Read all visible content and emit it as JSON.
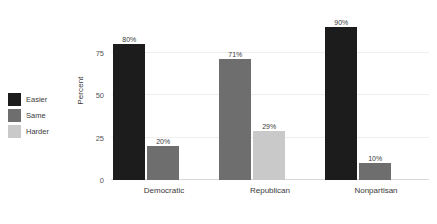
{
  "chart_data": {
    "type": "bar",
    "title": "",
    "subtitle": "",
    "xlabel": "",
    "ylabel": "Percent",
    "ylim": [
      0,
      100
    ],
    "yticks": [
      0,
      25,
      50,
      75
    ],
    "ytick_labels": [
      "0",
      "25",
      "50",
      "75"
    ],
    "grid": true,
    "grid_axis": "y",
    "legend_position": "left-outside",
    "categories": [
      "Democratic",
      "Republican",
      "Nonpartisan"
    ],
    "series": [
      {
        "name": "Easier",
        "color": "#1c1c1c",
        "values": [
          80,
          null,
          90
        ],
        "labels": [
          "80%",
          "",
          "90%"
        ]
      },
      {
        "name": "Same",
        "color": "#6e6e6e",
        "values": [
          20,
          71,
          10
        ],
        "labels": [
          "20%",
          "71%",
          "10%"
        ]
      },
      {
        "name": "Harder",
        "color": "#c9c9c9",
        "values": [
          null,
          29,
          null
        ],
        "labels": [
          "",
          "29%",
          ""
        ]
      }
    ],
    "bars": [
      {
        "category": "Democratic",
        "series": "Easier",
        "value": 80,
        "label": "80%",
        "color": "#1c1c1c",
        "slot": 0
      },
      {
        "category": "Democratic",
        "series": "Same",
        "value": 20,
        "label": "20%",
        "color": "#6e6e6e",
        "slot": 1
      },
      {
        "category": "Republican",
        "series": "Same",
        "value": 71,
        "label": "71%",
        "color": "#6e6e6e",
        "slot": 0
      },
      {
        "category": "Republican",
        "series": "Harder",
        "value": 29,
        "label": "29%",
        "color": "#c9c9c9",
        "slot": 1
      },
      {
        "category": "Nonpartisan",
        "series": "Easier",
        "value": 90,
        "label": "90%",
        "color": "#1c1c1c",
        "slot": 0
      },
      {
        "category": "Nonpartisan",
        "series": "Same",
        "value": 10,
        "label": "10%",
        "color": "#6e6e6e",
        "slot": 1
      }
    ]
  },
  "legend": {
    "items": [
      {
        "label": "Easier",
        "color": "#1c1c1c"
      },
      {
        "label": "Same",
        "color": "#6e6e6e"
      },
      {
        "label": "Harder",
        "color": "#c9c9c9"
      }
    ]
  },
  "axes": {
    "y_title": "Percent",
    "y_tick_labels": [
      "0",
      "25",
      "50",
      "75"
    ],
    "x_tick_labels": [
      "Democratic",
      "Republican",
      "Nonpartisan"
    ]
  },
  "colors": {
    "background": "#ffffff",
    "gridline": "#eeeeee",
    "baseline": "#d8d8d8",
    "text": "#3a3a3a",
    "easier": "#1c1c1c",
    "same": "#6e6e6e",
    "harder": "#c9c9c9"
  }
}
